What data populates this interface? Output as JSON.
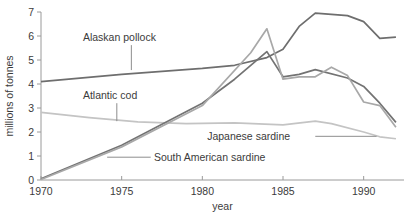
{
  "chart_data": {
    "type": "line",
    "title": "",
    "xlabel": "year",
    "ylabel": "millions of tonnes",
    "xlim": [
      1970,
      1992.5
    ],
    "ylim": [
      0,
      7
    ],
    "xticks": [
      "1970",
      "1975",
      "1980",
      "1985",
      "1990"
    ],
    "xtick_values": [
      1970,
      1975,
      1980,
      1985,
      1990
    ],
    "yticks": [
      "0",
      "1",
      "2",
      "3",
      "4",
      "5",
      "6",
      "7"
    ],
    "ytick_values": [
      0,
      1,
      2,
      3,
      4,
      5,
      6,
      7
    ],
    "grid": false,
    "legend": "inline-labels",
    "series": [
      {
        "name": "Alaskan pollock",
        "color": "#6e6e6e",
        "label_x": 1972.6,
        "label_y": 5.95,
        "leader": {
          "x": 1975.6,
          "y0": 5.62,
          "y1": 4.58
        },
        "x": [
          1970,
          1975,
          1980,
          1982,
          1984,
          1985,
          1986,
          1987,
          1989,
          1990,
          1991,
          1992
        ],
        "values": [
          4.1,
          4.4,
          4.65,
          4.78,
          5.1,
          5.45,
          6.4,
          6.95,
          6.85,
          6.6,
          5.9,
          5.95
        ]
      },
      {
        "name": "Atlantic cod",
        "color": "#c4c4c4",
        "label_x": 1972.6,
        "label_y": 3.52,
        "leader": {
          "x": 1974.7,
          "y0": 3.2,
          "y1": 2.45
        },
        "x": [
          1970,
          1973,
          1976,
          1979,
          1982,
          1985,
          1987,
          1988,
          1990,
          1991,
          1992
        ],
        "values": [
          2.82,
          2.6,
          2.42,
          2.35,
          2.38,
          2.3,
          2.45,
          2.35,
          2.0,
          1.8,
          1.72
        ]
      },
      {
        "name": "South American sardine",
        "color": "#737373",
        "label_x": 1977.0,
        "label_y": 0.95,
        "leader": {
          "x0": 1974.1,
          "x1": 1976.8,
          "y": 0.95
        },
        "x": [
          1970,
          1975,
          1980,
          1982,
          1984,
          1985,
          1986,
          1987,
          1989,
          1990,
          1991,
          1992
        ],
        "values": [
          0.05,
          1.45,
          3.2,
          4.2,
          5.35,
          4.3,
          4.4,
          4.6,
          4.25,
          3.9,
          3.2,
          2.4
        ]
      },
      {
        "name": "Japanese sardine",
        "color": "#a8a8a8",
        "label_x": 1980.3,
        "label_y": 1.82,
        "leader": {
          "x0": 1987.0,
          "x1": 1990.8,
          "y": 1.82
        },
        "x": [
          1970,
          1975,
          1980,
          1983,
          1984,
          1985,
          1986,
          1987,
          1988,
          1989,
          1990,
          1991,
          1992
        ],
        "values": [
          0.02,
          1.38,
          3.1,
          5.3,
          6.3,
          4.2,
          4.3,
          4.3,
          4.7,
          4.35,
          3.25,
          3.1,
          2.2
        ]
      }
    ]
  }
}
